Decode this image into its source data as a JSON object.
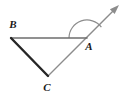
{
  "figure": {
    "kind": "geometry-diagram",
    "background_color": "#ffffff",
    "canvas": {
      "width": 127,
      "height": 97
    },
    "colors": {
      "dark_stroke": "#262626",
      "light_stroke": "#8c8c8c",
      "medium_stroke": "#6e6e6e",
      "arc_stroke": "#8c8c8c",
      "label_color": "#1a1a1a"
    },
    "points": {
      "B": {
        "x": 11,
        "y": 38
      },
      "A": {
        "x": 87,
        "y": 38
      },
      "C": {
        "x": 48,
        "y": 76
      },
      "ray_tip": {
        "x": 119,
        "y": 5
      }
    },
    "segments": [
      {
        "name": "BA",
        "from": "B",
        "to": "A",
        "color": "#6e6e6e",
        "width": 1.6
      },
      {
        "name": "BC",
        "from": "B",
        "to": "C",
        "color": "#262626",
        "width": 2.4
      },
      {
        "name": "CA-ray",
        "from": "C",
        "to": "ray_tip",
        "color": "#8c8c8c",
        "width": 1.4
      }
    ],
    "arrow": {
      "name": "ray-arrowhead",
      "tip_x": 119,
      "tip_y": 5,
      "color": "#8c8c8c"
    },
    "angle_arc": {
      "name": "angle-arc-at-A",
      "center": "A",
      "radius": 18,
      "start_angle_deg": 180,
      "end_angle_deg": 37,
      "color": "#8c8c8c",
      "width": 1.2
    },
    "labels": [
      {
        "id": "B",
        "text": "B",
        "x": 13,
        "y": 25
      },
      {
        "id": "A",
        "text": "A",
        "x": 89,
        "y": 47
      },
      {
        "id": "C",
        "text": "C",
        "x": 47,
        "y": 88
      }
    ]
  }
}
